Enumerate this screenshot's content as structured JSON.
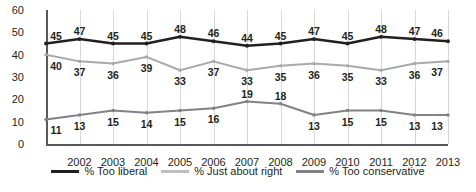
{
  "chart_data": {
    "type": "line",
    "title": "",
    "subtitle": "",
    "xlabel": "",
    "ylabel": "",
    "ylim": [
      0,
      60
    ],
    "ytick_labels": [
      "0",
      "10",
      "20",
      "30",
      "40",
      "50",
      "60"
    ],
    "yticks": [
      0,
      10,
      20,
      30,
      40,
      50,
      60
    ],
    "grid": "vertical",
    "legend_position": "bottom",
    "categories": [
      "",
      "2002",
      "2003",
      "2004",
      "2005",
      "2006",
      "2007",
      "2008",
      "2009",
      "2010",
      "2011",
      "2012",
      "2013"
    ],
    "xtick_labels": [
      "2002",
      "2003",
      "2004",
      "2005",
      "2006",
      "2007",
      "2008",
      "2009",
      "2010",
      "2011",
      "2012",
      "2013"
    ],
    "series": [
      {
        "name": "% Too liberal",
        "color": "#231f20",
        "values": [
          45,
          47,
          45,
          45,
          48,
          46,
          44,
          45,
          47,
          45,
          48,
          47,
          46
        ],
        "label_offsets": [
          "above",
          "above",
          "above",
          "above",
          "above",
          "above",
          "above",
          "above",
          "above",
          "above",
          "above",
          "above",
          "above"
        ]
      },
      {
        "name": "% Just about right",
        "color": "#a7a9ac",
        "values": [
          40,
          37,
          36,
          39,
          33,
          37,
          33,
          35,
          36,
          35,
          33,
          36,
          37
        ],
        "label_offsets": [
          "below",
          "below",
          "below",
          "below",
          "below",
          "below",
          "below",
          "below",
          "below",
          "below",
          "below",
          "below",
          "below"
        ]
      },
      {
        "name": "% Too conservative",
        "color": "#808285",
        "values": [
          11,
          13,
          15,
          14,
          15,
          16,
          19,
          18,
          13,
          15,
          15,
          13,
          13
        ],
        "label_offsets": [
          "below",
          "below",
          "below",
          "below",
          "below",
          "below",
          "above",
          "above",
          "below",
          "below",
          "below",
          "below",
          "below"
        ]
      }
    ]
  },
  "legend": {
    "items": [
      {
        "label": "% Too liberal",
        "color": "#231f20"
      },
      {
        "label": "% Just about right",
        "color": "#bcbec0"
      },
      {
        "label": "% Too conservative",
        "color": "#808285"
      }
    ]
  },
  "colors": {
    "axis": "#58595b",
    "gridline": "#d7d8da",
    "text": "#231f20",
    "background": "#ffffff"
  }
}
